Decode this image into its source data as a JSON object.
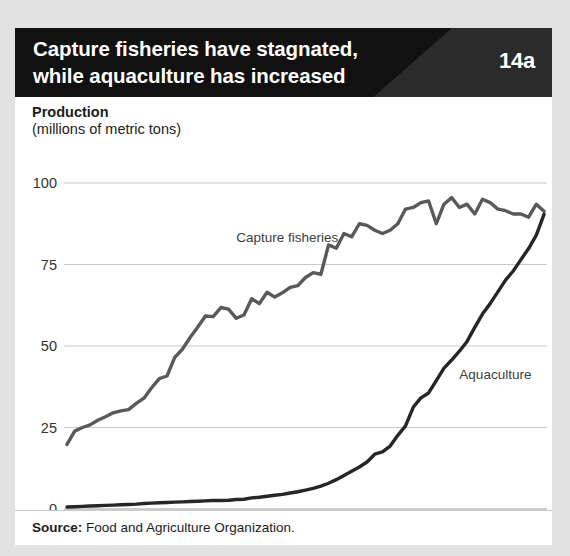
{
  "page": {
    "top_cutoff_text": "g   g p   p   ,   g",
    "background_color": "#e2e2e2",
    "card_background": "#ffffff"
  },
  "header": {
    "title_line1": "Capture fisheries have stagnated,",
    "title_line2": "while aquaculture has increased",
    "figure_number": "14a",
    "bar_color": "#111111",
    "badge_color": "#2b2b2b",
    "text_color": "#ffffff"
  },
  "footer": {
    "source_label": "Source:",
    "source_text": "Food and Agriculture Organization."
  },
  "chart_data": {
    "type": "line",
    "title": "Capture fisheries have stagnated, while aquaculture has increased",
    "axis_title": "Production",
    "axis_subtitle": "(millions of metric tons)",
    "xlabel": "",
    "ylabel": "Production (millions of metric tons)",
    "xlim": [
      1950,
      2012
    ],
    "ylim": [
      0,
      100
    ],
    "yticks": [
      0,
      25,
      50,
      75,
      100
    ],
    "ytick_labels": [
      "0",
      "25",
      "50",
      "75",
      "100"
    ],
    "xticks": [
      1950,
      1960,
      1970,
      1980,
      1990,
      2000,
      2012
    ],
    "xtick_labels": [
      "1950",
      "1960",
      "1970",
      "1980",
      "1990",
      "2000",
      "2012"
    ],
    "grid": "horizontal",
    "legend": "inline-labels",
    "x": [
      1950,
      1951,
      1952,
      1953,
      1954,
      1955,
      1956,
      1957,
      1958,
      1959,
      1960,
      1961,
      1962,
      1963,
      1964,
      1965,
      1966,
      1967,
      1968,
      1969,
      1970,
      1971,
      1972,
      1973,
      1974,
      1975,
      1976,
      1977,
      1978,
      1979,
      1980,
      1981,
      1982,
      1983,
      1984,
      1985,
      1986,
      1987,
      1988,
      1989,
      1990,
      1991,
      1992,
      1993,
      1994,
      1995,
      1996,
      1997,
      1998,
      1999,
      2000,
      2001,
      2002,
      2003,
      2004,
      2005,
      2006,
      2007,
      2008,
      2009,
      2010,
      2011,
      2012
    ],
    "series": [
      {
        "name": "Capture fisheries",
        "color": "#595959",
        "label_x": 1972,
        "label_y": 82,
        "values": [
          19.8,
          23.9,
          25.0,
          25.8,
          27.2,
          28.3,
          29.5,
          30.1,
          30.5,
          32.4,
          34.0,
          37.2,
          40.0,
          40.8,
          46.5,
          49.0,
          52.6,
          55.8,
          59.2,
          59.0,
          61.8,
          61.3,
          58.5,
          59.5,
          64.5,
          63.0,
          66.5,
          65.0,
          66.3,
          68.0,
          68.5,
          71.0,
          72.5,
          72.0,
          81.0,
          80.0,
          84.5,
          83.5,
          87.5,
          87.0,
          85.5,
          84.5,
          85.5,
          87.5,
          92.0,
          92.5,
          94.0,
          94.5,
          87.5,
          93.5,
          95.5,
          92.5,
          93.5,
          90.5,
          95.0,
          94.0,
          92.0,
          91.5,
          90.5,
          90.5,
          89.5,
          93.5,
          91.3
        ]
      },
      {
        "name": "Aquaculture",
        "color": "#262626",
        "label_x": 2001,
        "label_y": 40,
        "values": [
          0.6,
          0.7,
          0.8,
          0.9,
          1.0,
          1.1,
          1.2,
          1.3,
          1.4,
          1.5,
          1.7,
          1.8,
          1.9,
          2.0,
          2.1,
          2.2,
          2.3,
          2.4,
          2.5,
          2.6,
          2.6,
          2.7,
          2.9,
          3.0,
          3.4,
          3.6,
          3.9,
          4.2,
          4.5,
          4.9,
          5.3,
          5.8,
          6.3,
          7.0,
          7.9,
          9.0,
          10.3,
          11.6,
          12.9,
          14.4,
          16.8,
          17.5,
          19.3,
          22.6,
          25.5,
          31.2,
          34.1,
          35.6,
          39.4,
          43.2,
          45.7,
          48.4,
          51.4,
          55.7,
          59.8,
          63.0,
          66.6,
          70.2,
          73.0,
          76.5,
          79.9,
          84.0,
          90.4
        ]
      }
    ]
  }
}
